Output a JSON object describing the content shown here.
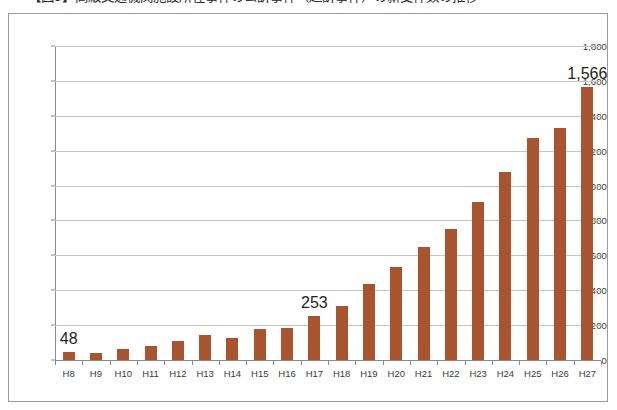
{
  "caption": {
    "text": "【図5】高級交通機関施設所在事件の公訴事件（起訴事件）の新受件数の推移"
  },
  "chart_data": {
    "type": "bar",
    "title": "",
    "xlabel": "",
    "ylabel": "",
    "ylim": [
      0,
      1800
    ],
    "ytick_step": 200,
    "ytick_labels": [
      "0",
      "200",
      "400",
      "600",
      "800",
      "1,000",
      "1,200",
      "1,400",
      "1,600",
      "1,800"
    ],
    "grid": true,
    "legend": "none",
    "bar_color": "#a8542e",
    "categories": [
      "H8",
      "H9",
      "H10",
      "H11",
      "H12",
      "H13",
      "H14",
      "H15",
      "H16",
      "H17",
      "H18",
      "H19",
      "H20",
      "H21",
      "H22",
      "H23",
      "H24",
      "H25",
      "H26",
      "H27"
    ],
    "values": [
      48,
      38,
      62,
      78,
      110,
      145,
      125,
      175,
      185,
      253,
      310,
      435,
      535,
      650,
      750,
      905,
      1075,
      1270,
      1330,
      1566
    ],
    "data_labels": [
      {
        "category": "H8",
        "text": "48"
      },
      {
        "category": "H17",
        "text": "253"
      },
      {
        "category": "H27",
        "text": "1,566"
      }
    ]
  }
}
